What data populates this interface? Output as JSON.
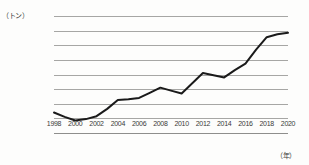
{
  "chart_data": {
    "type": "line",
    "title": "",
    "subtitle": "",
    "xlabel": "（年）",
    "ylabel": "（トン）",
    "unit_y": "（トン）",
    "unit_x": "（年）",
    "grid": true,
    "legend": "none",
    "xlim": [
      1998,
      2020
    ],
    "ylim": [
      0,
      8000
    ],
    "y_ticks": [
      0,
      1000,
      2000,
      3000,
      4000,
      5000,
      6000,
      7000,
      8000
    ],
    "y_tick_labels": [
      "0",
      "1,000",
      "2,000",
      "3,000",
      "4,000",
      "5,000",
      "6,000",
      "7,000",
      "8,000"
    ],
    "x_ticks": [
      1998,
      2000,
      2002,
      2004,
      2006,
      2008,
      2010,
      2012,
      2014,
      2016,
      2018,
      2020
    ],
    "x_tick_labels": [
      "1998",
      "2000",
      "2002",
      "2004",
      "2006",
      "2008",
      "2010",
      "2012",
      "2014",
      "2016",
      "2018",
      "2020"
    ],
    "x": [
      1998,
      1999,
      2000,
      2001,
      2002,
      2003,
      2004,
      2005,
      2006,
      2007,
      2008,
      2009,
      2010,
      2011,
      2012,
      2013,
      2014,
      2015,
      2016,
      2017,
      2018,
      2019,
      2020
    ],
    "values": [
      1400,
      1100,
      850,
      950,
      1150,
      1650,
      2250,
      2300,
      2400,
      2750,
      3100,
      2900,
      2700,
      3400,
      4100,
      3950,
      3800,
      4300,
      4750,
      5700,
      6550,
      6750,
      6850
    ],
    "series": [
      {
        "name": "",
        "color": "#1a1a1a",
        "values": [
          1400,
          1100,
          850,
          950,
          1150,
          1650,
          2250,
          2300,
          2400,
          2750,
          3100,
          2900,
          2700,
          3400,
          4100,
          3950,
          3800,
          4300,
          4750,
          5700,
          6550,
          6750,
          6850
        ]
      }
    ],
    "colors": {
      "line": "#1a1a1a",
      "grid": "#a6a6a4",
      "text": "#3a3a38",
      "background": "#fdfdfc"
    }
  }
}
